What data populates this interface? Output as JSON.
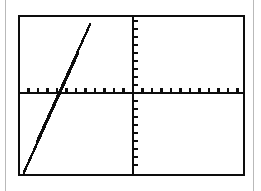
{
  "page": {
    "background_color": "#ffffff",
    "width": 261,
    "height": 191,
    "rule_color": "#b9b9b9",
    "left_rule_x": 5,
    "right_rule_x": 253
  },
  "calculator_screen": {
    "label": "Graphing calculator display",
    "border_color": "#0d0d0d",
    "border_width": 2,
    "x": 18,
    "y": 15,
    "width": 227,
    "height": 161,
    "fill": "#ffffff"
  },
  "chart_data": {
    "type": "line",
    "title": "",
    "subtitle": "",
    "xlabel": "",
    "ylabel": "",
    "grid": false,
    "legend": false,
    "legend_position": "none",
    "axis_color": "#0d0d0d",
    "axis_width": 2.6,
    "tick_color": "#0d0d0d",
    "tick_width": 2.2,
    "curve_color": "#0d0d0d",
    "curve_width": 2.6,
    "origin_px": {
      "x": 113,
      "y": 76
    },
    "x_axis": {
      "pixel_y": 76,
      "pixel_x_start": 0,
      "pixel_x_end": 223,
      "tick_spacing_px": 9.5,
      "tick_length_px": 5,
      "tick_count_left": 11,
      "tick_count_right": 11,
      "range": [
        -12,
        11
      ],
      "tick_step": 1
    },
    "y_axis": {
      "pixel_x": 113,
      "pixel_y_start": 0,
      "pixel_y_end": 157,
      "tick_spacing_px": 8,
      "tick_length_px": 5,
      "tick_count_above": 9,
      "tick_count_below": 9,
      "range": [
        -10,
        9
      ],
      "tick_step": 1
    },
    "series": [
      {
        "name": "y = mx + b",
        "style": "stepped-pixel-line",
        "slope_px": -2.24,
        "x_intercept_px": 40,
        "y_intercept_px": -14,
        "points_px": [
          {
            "x": 4,
            "y": 157
          },
          {
            "x": 71,
            "y": 7
          }
        ],
        "x_intercept_units": -7.7,
        "y_intercept_units": 1.75,
        "slope_units": 0.226
      }
    ]
  }
}
